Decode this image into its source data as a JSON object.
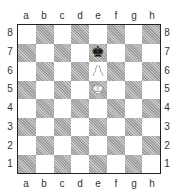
{
  "board": {
    "files": [
      "a",
      "b",
      "c",
      "d",
      "e",
      "f",
      "g",
      "h"
    ],
    "ranks": [
      "8",
      "7",
      "6",
      "5",
      "4",
      "3",
      "2",
      "1"
    ],
    "colors": {
      "light": "#ffffff",
      "dark": "#b9b9b9",
      "border": "#222222"
    },
    "pieces": [
      {
        "square": "e7",
        "type": "king",
        "color": "black",
        "glyph": "♚"
      },
      {
        "square": "e6",
        "type": "pawn",
        "color": "white",
        "glyph": "♟"
      },
      {
        "square": "e5",
        "type": "king",
        "color": "white",
        "glyph": "♚"
      }
    ]
  }
}
